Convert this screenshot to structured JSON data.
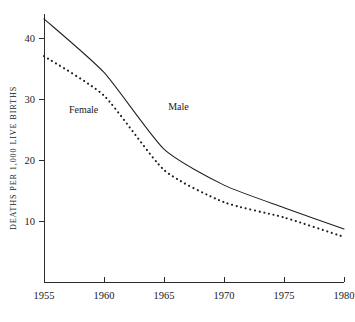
{
  "chart_data": {
    "type": "line",
    "title": "",
    "subtitle": "",
    "xlabel": "",
    "ylabel": "DEATHS PER 1,000 LIVE BIRTHS",
    "x": [
      1955,
      1960,
      1965,
      1970,
      1975,
      1980
    ],
    "xlim": [
      1955,
      1980
    ],
    "ylim": [
      0,
      44
    ],
    "xticks": [
      1955,
      1960,
      1965,
      1970,
      1975,
      1980
    ],
    "xtick_labels": [
      "1955",
      "1960",
      "1965",
      "1970",
      "1975",
      "1980"
    ],
    "yticks": [
      10,
      20,
      30,
      40
    ],
    "ytick_labels": [
      "10",
      "20",
      "30",
      "40"
    ],
    "grid": false,
    "legend_position": "inline-annotation",
    "series": [
      {
        "name": "Male",
        "style": "solid",
        "label_x": 1966.2,
        "label_y": 28.2,
        "values": [
          43.2,
          34.4,
          21.8,
          15.9,
          12.2,
          8.7
        ]
      },
      {
        "name": "Female",
        "style": "dotted",
        "label_x": 1958.3,
        "label_y": 27.8,
        "values": [
          37.1,
          30.6,
          18.4,
          13.1,
          10.6,
          7.4
        ]
      }
    ],
    "annotations": [
      {
        "text": "Female",
        "x": 1958.3,
        "y": 27.8
      },
      {
        "text": "Male",
        "x": 1966.2,
        "y": 28.2
      }
    ]
  },
  "axis": {
    "y_title": "DEATHS PER 1,000 LIVE BIRTHS"
  }
}
